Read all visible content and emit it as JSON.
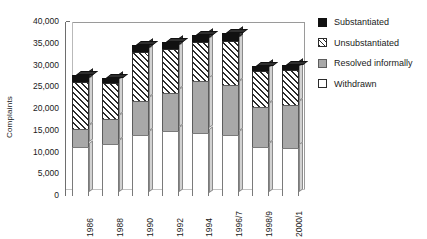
{
  "chart_data": {
    "type": "bar",
    "subtype": "stacked-column-3d",
    "title": "",
    "xlabel": "",
    "ylabel": "Complaints",
    "ylim": [
      0,
      40000
    ],
    "ytick_step": 5000,
    "yticks": [
      "40,000",
      "35,000",
      "30,000",
      "25,000",
      "20,000",
      "15,000",
      "10,000",
      "5,000",
      "0"
    ],
    "ytick_values": [
      40000,
      35000,
      30000,
      25000,
      20000,
      15000,
      10000,
      5000,
      0
    ],
    "grid": false,
    "legend_position": "right",
    "categories": [
      "1986",
      "1988",
      "1990",
      "1992",
      "1994",
      "1996/7",
      "1998/9",
      "2000/1"
    ],
    "series": [
      {
        "name": "Withdrawn",
        "color": "#ffffff",
        "pattern": "solid",
        "values": [
          11300,
          12000,
          14000,
          15000,
          14600,
          14000,
          11300,
          11000
        ]
      },
      {
        "name": "Resolved informally",
        "color": "#a8a8a8",
        "pattern": "solid",
        "values": [
          4000,
          5700,
          7800,
          8700,
          11800,
          11500,
          9200,
          10000
        ]
      },
      {
        "name": "Unsubstantiated",
        "color": "#ffffff",
        "pattern": "diagonal-hatch",
        "values": [
          10800,
          8300,
          11300,
          10000,
          9100,
          10200,
          8300,
          8000
        ]
      },
      {
        "name": "Substantiated",
        "color": "#111111",
        "pattern": "solid",
        "values": [
          1700,
          1200,
          1700,
          1600,
          1500,
          1800,
          1200,
          1200
        ]
      }
    ],
    "totals": [
      27800,
      27200,
      34800,
      35300,
      37000,
      37500,
      30000,
      30200
    ]
  },
  "legend": {
    "items": [
      {
        "label": "Substantiated",
        "swatch": "sw-sub"
      },
      {
        "label": "Unsubstantiated",
        "swatch": "sw-unsub"
      },
      {
        "label": "Resolved informally",
        "swatch": "sw-res"
      },
      {
        "label": "Withdrawn",
        "swatch": "sw-wd"
      }
    ]
  }
}
